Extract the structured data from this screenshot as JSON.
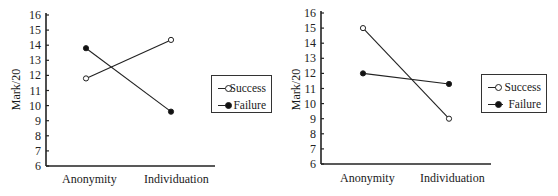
{
  "chart_data": [
    {
      "type": "line",
      "title": "",
      "xlabel": "",
      "ylabel": "Mark/20",
      "ylim": [
        6,
        16
      ],
      "yticks": [
        6,
        7,
        8,
        9,
        10,
        11,
        12,
        13,
        14,
        15,
        16
      ],
      "categories": [
        "Anonymity",
        "Individuation"
      ],
      "grid": false,
      "legend_position": "right",
      "series": [
        {
          "name": "Success",
          "marker": "open-circle",
          "values": [
            11.8,
            14.35
          ]
        },
        {
          "name": "Failure",
          "marker": "filled-circle",
          "values": [
            13.8,
            9.6
          ]
        }
      ]
    },
    {
      "type": "line",
      "title": "",
      "xlabel": "",
      "ylabel": "Mark/20",
      "ylim": [
        6,
        16
      ],
      "yticks": [
        6,
        7,
        8,
        9,
        10,
        11,
        12,
        13,
        14,
        15,
        16
      ],
      "categories": [
        "Anonymity",
        "Individuation"
      ],
      "grid": false,
      "legend_position": "right",
      "series": [
        {
          "name": "Success",
          "marker": "open-circle",
          "values": [
            15.0,
            9.0
          ]
        },
        {
          "name": "Failure",
          "marker": "filled-circle",
          "values": [
            12.0,
            11.3
          ]
        }
      ]
    }
  ],
  "charts": [
    {
      "ylabel": "Mark/20",
      "categories": [
        "Anonymity",
        "Individuation"
      ],
      "legend": [
        "Success",
        "Failure"
      ]
    },
    {
      "ylabel": "Mark/20",
      "categories": [
        "Anonymity",
        "Individuation"
      ],
      "legend": [
        "Success",
        "Failure"
      ]
    }
  ]
}
